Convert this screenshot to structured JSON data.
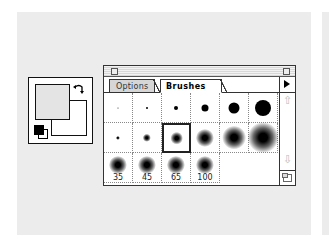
{
  "color_box": {
    "foreground_color": "#e4e4e4",
    "background_color": "#ffffff",
    "swap_icon": "swap-arrows-icon",
    "default_colors_icon": "default-colors-icon"
  },
  "palette": {
    "tabs": [
      {
        "label": "Options",
        "active": false
      },
      {
        "label": "Brushes",
        "active": true
      }
    ],
    "menu_icon": "triangle-right-icon",
    "brushes": [
      {
        "row": 0,
        "col": 0,
        "size": 1,
        "soft": false,
        "label": ""
      },
      {
        "row": 0,
        "col": 1,
        "size": 2,
        "soft": false,
        "label": ""
      },
      {
        "row": 0,
        "col": 2,
        "size": 4,
        "soft": false,
        "label": ""
      },
      {
        "row": 0,
        "col": 3,
        "size": 7,
        "soft": false,
        "label": ""
      },
      {
        "row": 0,
        "col": 4,
        "size": 11,
        "soft": false,
        "label": ""
      },
      {
        "row": 0,
        "col": 5,
        "size": 16,
        "soft": false,
        "label": ""
      },
      {
        "row": 1,
        "col": 0,
        "size": 3,
        "soft": true,
        "label": ""
      },
      {
        "row": 1,
        "col": 1,
        "size": 6,
        "soft": true,
        "label": ""
      },
      {
        "row": 1,
        "col": 2,
        "size": 9,
        "soft": true,
        "label": "",
        "selected": true
      },
      {
        "row": 1,
        "col": 3,
        "size": 13,
        "soft": true,
        "label": ""
      },
      {
        "row": 1,
        "col": 4,
        "size": 17,
        "soft": true,
        "label": ""
      },
      {
        "row": 1,
        "col": 5,
        "size": 22,
        "soft": true,
        "label": ""
      },
      {
        "row": 2,
        "col": 0,
        "size": 13,
        "soft": true,
        "label": "35"
      },
      {
        "row": 2,
        "col": 1,
        "size": 13,
        "soft": true,
        "label": "45"
      },
      {
        "row": 2,
        "col": 2,
        "size": 13,
        "soft": true,
        "label": "65"
      },
      {
        "row": 2,
        "col": 3,
        "size": 13,
        "soft": true,
        "label": "100"
      }
    ],
    "scroll_up_icon": "⇧",
    "scroll_down_icon": "⇩"
  }
}
